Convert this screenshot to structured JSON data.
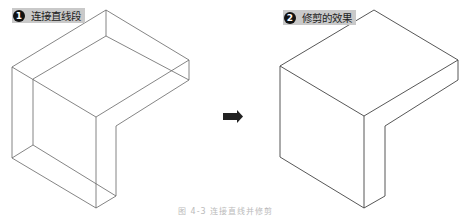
{
  "panels": [
    {
      "step": "1",
      "label": "连接直线段",
      "style": "wireframe-with-construction-lines"
    },
    {
      "step": "2",
      "label": "修剪的效果",
      "style": "trimmed-outline"
    }
  ],
  "arrow": {
    "icon": "right-arrow-icon",
    "color": "#222222"
  },
  "caption": "图 4-3  连接直线并修剪",
  "colors": {
    "line": "#555555",
    "label_bg": "#c9c9c9",
    "badge": "#111111"
  }
}
